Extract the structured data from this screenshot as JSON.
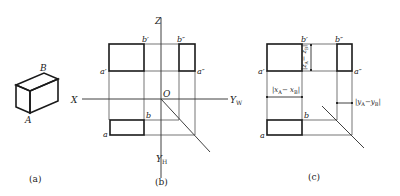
{
  "figure": {
    "panels": [
      {
        "id": "a",
        "caption": "(a)",
        "description": "Isometric view of rectangular block with points A and B",
        "labels": {
          "A": "A",
          "B": "B"
        }
      },
      {
        "id": "b",
        "caption": "(b)",
        "description": "Three-view projection with axes",
        "axes": {
          "Z": "Z",
          "X": "X",
          "O": "O",
          "YW": "Y",
          "YW_sub": "W",
          "YH": "Y",
          "YH_sub": "H"
        },
        "points": {
          "a_prime": "a′",
          "b_prime": "b′",
          "b_dprime": "b″",
          "a_dprime": "a″",
          "a": "a",
          "b": "b"
        }
      },
      {
        "id": "c",
        "caption": "(c)",
        "description": "Three-view projection showing coordinate differences",
        "points": {
          "a_prime": "a′",
          "b_prime": "b′",
          "b_dprime": "b″",
          "a_dprime": "a″",
          "a": "a",
          "b": "b"
        },
        "dimensions": {
          "dx": "|x",
          "dx_A": "A",
          "dx_mid": "− x",
          "dx_B": "B",
          "dx_end": "|",
          "dy": "|y",
          "dy_A": "A",
          "dy_mid": "−y",
          "dy_B": "B",
          "dy_end": "|",
          "dz": "|z",
          "dz_A": "A",
          "dz_mid": "− z",
          "dz_B": "B",
          "dz_end": "|"
        }
      }
    ]
  },
  "colors": {
    "line": "#1a1a1a",
    "background": "#ffffff"
  }
}
